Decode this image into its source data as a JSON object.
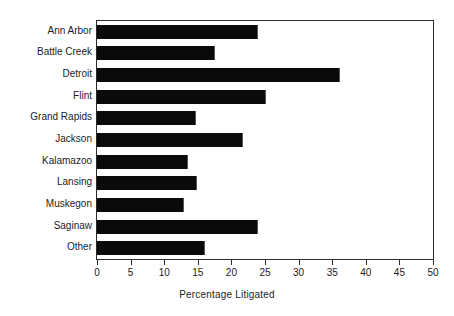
{
  "chart_data": {
    "type": "bar",
    "orientation": "horizontal",
    "title": "",
    "subtitle": "",
    "xlabel": "Percentage Litigated",
    "ylabel": "",
    "xlim": [
      0,
      50
    ],
    "xticks": [
      0,
      5,
      10,
      15,
      20,
      25,
      30,
      35,
      40,
      45,
      50
    ],
    "xtick_labels": [
      "0",
      "5",
      "10",
      "15",
      "20",
      "25",
      "30",
      "35",
      "40",
      "45",
      "50"
    ],
    "grid": false,
    "legend": null,
    "bar_color": "#0a0a0a",
    "frame_color": "#2b2b2b",
    "background": "#ffffff",
    "categories": [
      "Ann Arbor",
      "Battle Creek",
      "Detroit",
      "Flint",
      "Grand Rapids",
      "Jackson",
      "Kalamazoo",
      "Lansing",
      "Muskegon",
      "Saginaw",
      "Other"
    ],
    "values": [
      24.0,
      17.5,
      36.1,
      25.1,
      14.8,
      21.7,
      13.6,
      14.9,
      13.0,
      24.0,
      16.1
    ],
    "series": [
      {
        "name": "Percentage Litigated",
        "values": [
          24.0,
          17.5,
          36.1,
          25.1,
          14.8,
          21.7,
          13.6,
          14.9,
          13.0,
          24.0,
          16.1
        ]
      }
    ]
  }
}
